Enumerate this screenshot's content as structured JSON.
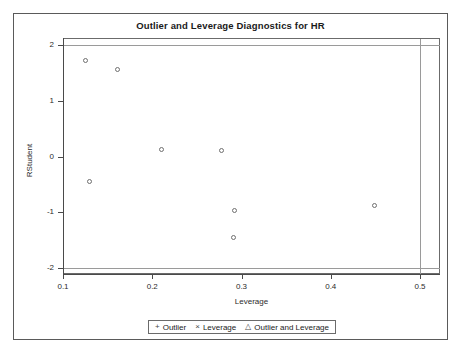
{
  "chart_data": {
    "type": "scatter",
    "title": "Outlier and Leverage Diagnostics for HR",
    "xlabel": "Leverage",
    "ylabel": "RStudent",
    "xlim": [
      0.1,
      0.5
    ],
    "ylim": [
      -2,
      2
    ],
    "xticks": [
      "0.1",
      "0.2",
      "0.3",
      "0.4",
      "0.5"
    ],
    "xtick_values": [
      0.1,
      0.2,
      0.3,
      0.4,
      0.5
    ],
    "yticks": [
      "2",
      "1",
      "0",
      "-1",
      "-2"
    ],
    "ytick_values": [
      2,
      1,
      0,
      -1,
      -2
    ],
    "grid": false,
    "points": [
      {
        "x": 0.126,
        "y": 1.72
      },
      {
        "x": 0.162,
        "y": 1.56
      },
      {
        "x": 0.13,
        "y": -0.46
      },
      {
        "x": 0.211,
        "y": 0.12
      },
      {
        "x": 0.278,
        "y": 0.1
      },
      {
        "x": 0.293,
        "y": -0.97
      },
      {
        "x": 0.292,
        "y": -1.47
      },
      {
        "x": 0.45,
        "y": -0.88
      }
    ],
    "reference_lines": [
      {
        "orientation": "horizontal",
        "value": 2,
        "label": "rstudent-upper-cutoff"
      },
      {
        "orientation": "horizontal",
        "value": -2,
        "label": "rstudent-lower-cutoff"
      },
      {
        "orientation": "vertical",
        "value": 0.5,
        "label": "leverage-cutoff"
      }
    ],
    "legend_position": "bottom",
    "legend": [
      {
        "symbol": "+",
        "label": "Outlier"
      },
      {
        "symbol": "×",
        "label": "Leverage"
      },
      {
        "symbol": "△",
        "label": "Outlier and Leverage"
      }
    ]
  }
}
